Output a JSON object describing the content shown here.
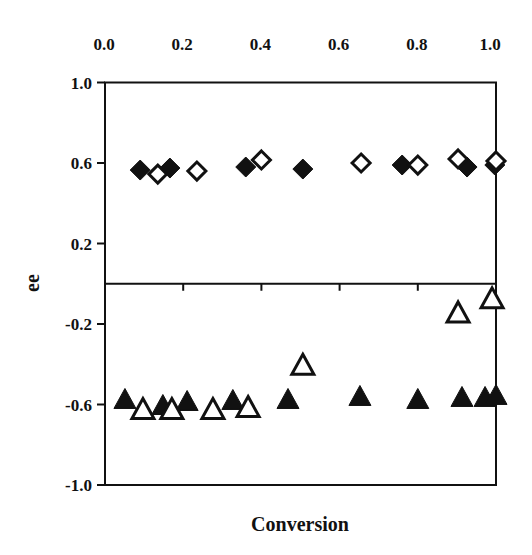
{
  "chart_data": {
    "type": "scatter",
    "title": "",
    "xlabel": "Conversion",
    "ylabel": "ee",
    "xlim": [
      0.0,
      1.0
    ],
    "ylim": [
      -1.0,
      1.0
    ],
    "x_ticks": [
      "0.0",
      "0.2",
      "0.4",
      "0.6",
      "0.8",
      "1.0"
    ],
    "x_tick_values": [
      0.0,
      0.2,
      0.4,
      0.6,
      0.8,
      1.0
    ],
    "x_axis_position": "top",
    "y_ticks": [
      "1.0",
      "0.6",
      "0.2",
      "-0.2",
      "-0.6",
      "-1.0"
    ],
    "y_tick_values": [
      1.0,
      0.6,
      0.2,
      -0.2,
      -0.6,
      -1.0
    ],
    "zero_line": true,
    "grid": false,
    "legend": null,
    "series": [
      {
        "name": "filled diamond",
        "marker": "diamond",
        "filled": true,
        "points": [
          {
            "x": 0.09,
            "y": 0.565
          },
          {
            "x": 0.166,
            "y": 0.575
          },
          {
            "x": 0.36,
            "y": 0.58
          },
          {
            "x": 0.506,
            "y": 0.57
          },
          {
            "x": 0.76,
            "y": 0.59
          },
          {
            "x": 0.926,
            "y": 0.58
          },
          {
            "x": 0.997,
            "y": 0.59
          }
        ]
      },
      {
        "name": "open diamond",
        "marker": "diamond",
        "filled": false,
        "points": [
          {
            "x": 0.135,
            "y": 0.545
          },
          {
            "x": 0.235,
            "y": 0.56
          },
          {
            "x": 0.4,
            "y": 0.615
          },
          {
            "x": 0.655,
            "y": 0.6
          },
          {
            "x": 0.8,
            "y": 0.59
          },
          {
            "x": 0.903,
            "y": 0.62
          },
          {
            "x": 1.0,
            "y": 0.61
          }
        ]
      },
      {
        "name": "filled triangle",
        "marker": "triangle",
        "filled": true,
        "points": [
          {
            "x": 0.051,
            "y": -0.58
          },
          {
            "x": 0.148,
            "y": -0.61
          },
          {
            "x": 0.21,
            "y": -0.59
          },
          {
            "x": 0.327,
            "y": -0.585
          },
          {
            "x": 0.468,
            "y": -0.58
          },
          {
            "x": 0.652,
            "y": -0.565
          },
          {
            "x": 0.8,
            "y": -0.58
          },
          {
            "x": 0.913,
            "y": -0.57
          },
          {
            "x": 0.972,
            "y": -0.57
          },
          {
            "x": 1.0,
            "y": -0.56
          }
        ]
      },
      {
        "name": "open triangle",
        "marker": "triangle",
        "filled": false,
        "points": [
          {
            "x": 0.097,
            "y": -0.63
          },
          {
            "x": 0.171,
            "y": -0.63
          },
          {
            "x": 0.276,
            "y": -0.63
          },
          {
            "x": 0.366,
            "y": -0.62
          },
          {
            "x": 0.506,
            "y": -0.41
          },
          {
            "x": 0.903,
            "y": -0.15
          },
          {
            "x": 0.99,
            "y": -0.08
          }
        ]
      }
    ]
  },
  "colors": {
    "ink": "#111111",
    "background": "#ffffff"
  },
  "plot_px": {
    "left": 105,
    "right": 496,
    "top": 82.5,
    "bottom": 485
  }
}
